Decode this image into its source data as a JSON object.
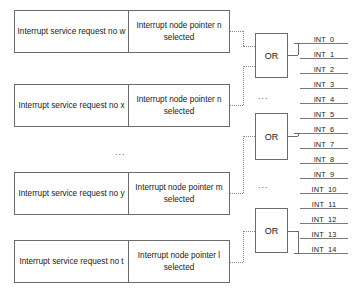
{
  "diagram": {
    "colors": {
      "box_border": "#6b6b6b",
      "wire_solid": "#6b6b6b",
      "wire_dotted": "#8a8a8a",
      "text": "#1a1a1a",
      "background": "#ffffff"
    },
    "ellipsis_text": "...",
    "request_boxes": [
      {
        "id": "request-box-w",
        "left_label": "Interrupt service request no w",
        "right_label": "Interrupt node pointer n selected",
        "x": 14,
        "y": 10,
        "width": 216,
        "height": 43
      },
      {
        "id": "request-box-x",
        "left_label": "Interrupt service request no x",
        "right_label": "Interrupt node pointer n selected",
        "x": 14,
        "y": 84,
        "width": 216,
        "height": 43
      },
      {
        "id": "request-box-y",
        "left_label": "Interrupt service request no y",
        "right_label": "Interrupt node pointer m selected",
        "x": 14,
        "y": 172,
        "width": 216,
        "height": 43
      },
      {
        "id": "request-box-t",
        "left_label": "Interrupt service request no t",
        "right_label": "Interrupt node pointer l selected",
        "x": 14,
        "y": 240,
        "width": 216,
        "height": 43
      }
    ],
    "or_gates": [
      {
        "id": "or-gate-1",
        "label": "OR",
        "x": 255,
        "y": 33,
        "width": 33,
        "height": 45
      },
      {
        "id": "or-gate-2",
        "label": "OR",
        "x": 255,
        "y": 113,
        "width": 33,
        "height": 47
      },
      {
        "id": "or-gate-3",
        "label": "OR",
        "x": 255,
        "y": 208,
        "width": 33,
        "height": 45
      }
    ],
    "interrupt_outputs": [
      {
        "name": "INT_0",
        "y": 43
      },
      {
        "name": "INT_1",
        "y": 58
      },
      {
        "name": "INT_2",
        "y": 73
      },
      {
        "name": "INT_3",
        "y": 88
      },
      {
        "name": "INT_4",
        "y": 103
      },
      {
        "name": "INT_5",
        "y": 118
      },
      {
        "name": "INT_6",
        "y": 133
      },
      {
        "name": "INT_7",
        "y": 148
      },
      {
        "name": "INT_8",
        "y": 163
      },
      {
        "name": "INT_9",
        "y": 178
      },
      {
        "name": "INT_10",
        "y": 193
      },
      {
        "name": "INT_11",
        "y": 208
      },
      {
        "name": "INT_12",
        "y": 223
      },
      {
        "name": "INT_13",
        "y": 238
      },
      {
        "name": "INT_14",
        "y": 253
      }
    ],
    "ellipsis_markers": [
      {
        "id": "ellipsis-between-boxes",
        "x": 115,
        "y": 148
      },
      {
        "id": "ellipsis-between-or-1-2",
        "x": 258,
        "y": 92
      },
      {
        "id": "ellipsis-between-or-2-3",
        "x": 258,
        "y": 181
      }
    ]
  }
}
